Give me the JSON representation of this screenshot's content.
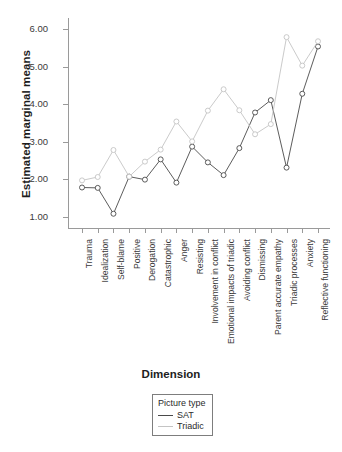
{
  "chart_data": {
    "type": "line",
    "title": "",
    "xlabel": "Dimension",
    "ylabel": "Estimated marginal means",
    "ylim": [
      0.7,
      6.3
    ],
    "yticks": [
      1.0,
      2.0,
      3.0,
      4.0,
      5.0,
      6.0
    ],
    "ytick_labels": [
      "1.00",
      "2.00",
      "3.00",
      "4.00",
      "5.00",
      "6.00"
    ],
    "grid": false,
    "legend_position": "bottom-center",
    "legend_title": "Picture type",
    "categories": [
      "Trauma",
      "Idealization",
      "Self-blame",
      "Positive",
      "Derogation",
      "Catastrophic",
      "Anger",
      "Resisting",
      "Involvement in conflict",
      "Emotional impacts of triadic",
      "Avoiding conflict",
      "Dismissing",
      "Parent accurate empathy",
      "Triadic processes",
      "Anxiety",
      "Reflective functioning"
    ],
    "series": [
      {
        "name": "SAT",
        "color": "#4a4a4a",
        "values": [
          1.78,
          1.77,
          1.08,
          2.07,
          1.99,
          2.53,
          1.91,
          2.87,
          2.45,
          2.11,
          2.83,
          3.78,
          4.11,
          2.31,
          4.28,
          5.54
        ]
      },
      {
        "name": "Triadic",
        "color": "#c4c4c4",
        "values": [
          1.97,
          2.06,
          2.78,
          2.07,
          2.47,
          2.79,
          3.54,
          3.01,
          3.83,
          4.4,
          3.84,
          3.2,
          3.47,
          5.79,
          5.03,
          5.68
        ]
      }
    ]
  },
  "legend": {
    "title": "Picture type",
    "entries": [
      {
        "label": "SAT",
        "color": "#4a4a4a"
      },
      {
        "label": "Triadic",
        "color": "#c4c4c4"
      }
    ]
  }
}
